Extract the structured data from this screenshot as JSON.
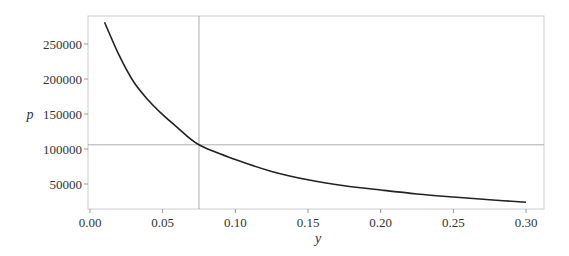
{
  "chart_data": {
    "type": "line",
    "title": "",
    "xlabel": "y",
    "ylabel": "p",
    "xlim": [
      -0.002,
      0.31
    ],
    "ylim": [
      15000,
      285000
    ],
    "grid": false,
    "legend": null,
    "x_ticks": [
      0.0,
      0.05,
      0.1,
      0.15,
      0.2,
      0.25,
      0.3
    ],
    "x_tick_labels": [
      "0.00",
      "0.05",
      "0.10",
      "0.15",
      "0.20",
      "0.25",
      "0.30"
    ],
    "y_ticks": [
      50000,
      100000,
      150000,
      200000,
      250000
    ],
    "y_tick_labels": [
      "50000",
      "100000",
      "150000",
      "200000",
      "250000"
    ],
    "series": [
      {
        "name": "p(y)",
        "color": "#222222",
        "x": [
          0.01,
          0.02,
          0.03,
          0.04,
          0.05,
          0.06,
          0.075,
          0.1,
          0.125,
          0.15,
          0.175,
          0.2,
          0.225,
          0.25,
          0.275,
          0.3
        ],
        "values": [
          281000,
          234000,
          196000,
          170000,
          149000,
          131000,
          106000,
          85000,
          68000,
          56000,
          47500,
          41400,
          35800,
          31400,
          27500,
          24000
        ]
      }
    ],
    "reference_lines": {
      "vertical_x": 0.075,
      "horizontal_y": 106000,
      "color": "#999999"
    }
  }
}
